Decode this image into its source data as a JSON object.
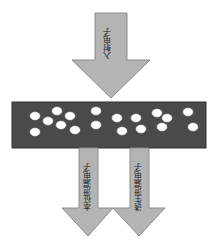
{
  "diagram": {
    "incident_arrow": {
      "label": "入射电子"
    },
    "material_layer": {
      "color": "#4a4a4a",
      "particle_count": 20
    },
    "intrinsic_leak_arrow": {
      "label": "本征泄漏电子"
    },
    "induced_leak_arrow": {
      "label": "诱生泄漏电子"
    },
    "colors": {
      "arrow_fill": "#b4b4b4",
      "arrow_stroke": "#8c8c8c",
      "layer_fill": "#4a4a4a",
      "particle_fill": "#ffffff"
    }
  }
}
